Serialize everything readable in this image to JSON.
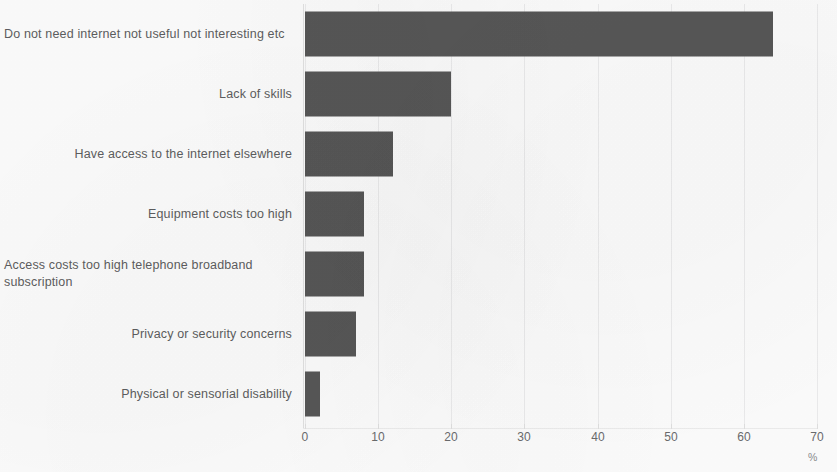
{
  "chart_data": {
    "type": "bar",
    "orientation": "horizontal",
    "title": "",
    "subtitle": "",
    "xlabel": "%",
    "ylabel": "",
    "xlim": [
      0,
      70
    ],
    "xticks": [
      0,
      10,
      20,
      30,
      40,
      50,
      60,
      70
    ],
    "xtick_labels": [
      "0",
      "10",
      "20",
      "30",
      "40",
      "50",
      "60",
      "70"
    ],
    "grid": true,
    "grid_axis": "x",
    "legend": false,
    "bar_color": "#575757",
    "background_color": "#fdfdfd",
    "categories": [
      "Do not need internet not useful not interesting etc",
      "Lack of skills",
      "Have access to the internet elsewhere",
      "Equipment costs too high",
      "Access costs too high telephone broadband subscription",
      "Privacy or security concerns",
      "Physical or sensorial disability"
    ],
    "values": [
      64,
      20,
      12,
      8,
      8,
      7,
      2
    ],
    "series": [
      {
        "name": "Share of respondents",
        "values": [
          64,
          20,
          12,
          8,
          8,
          7,
          2
        ]
      }
    ]
  },
  "rows": [
    {
      "label": "Do not need internet not useful not interesting etc",
      "value": 64,
      "multiline": true
    },
    {
      "label": "Lack of skills",
      "value": 20,
      "multiline": false
    },
    {
      "label": "Have access to the internet elsewhere",
      "value": 12,
      "multiline": false
    },
    {
      "label": "Equipment costs too high",
      "value": 8,
      "multiline": false
    },
    {
      "label": "Access costs too high telephone broadband subscription",
      "value": 8,
      "multiline": true
    },
    {
      "label": "Privacy or security concerns",
      "value": 7,
      "multiline": false
    },
    {
      "label": "Physical or sensorial disability",
      "value": 2,
      "multiline": false
    }
  ],
  "axis": {
    "unit_label": "%",
    "ticks": [
      "0",
      "10",
      "20",
      "30",
      "40",
      "50",
      "60",
      "70"
    ]
  }
}
